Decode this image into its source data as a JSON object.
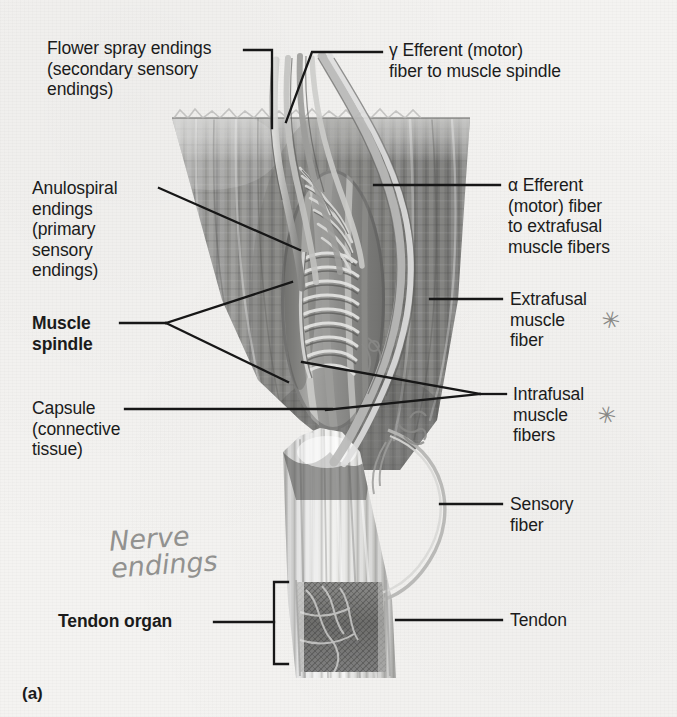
{
  "figure": {
    "id_label": "(a)",
    "domain_note": "scanned textbook anatomy figure of muscle spindle and tendon organ"
  },
  "labels": {
    "flower_spray": "Flower spray endings\n(secondary sensory\nendings)",
    "gamma_efferent": "γ Efferent (motor)\nfiber to muscle spindle",
    "anulospiral": "Anulospiral\nendings\n(primary\nsensory\nendings)",
    "muscle_spindle": "Muscle\nspindle",
    "capsule": "Capsule\n(connective\ntissue)",
    "alpha_efferent": "α Efferent\n(motor) fiber\nto extrafusal\nmuscle fibers",
    "extrafusal": "Extrafusal\nmuscle\nfiber",
    "intrafusal": "Intrafusal\nmuscle\nfibers",
    "sensory_fiber": "Sensory\nfiber",
    "tendon": "Tendon",
    "tendon_organ": "Tendon organ"
  },
  "annotations": {
    "handwritten_note": "Nerve\nendings",
    "star_extrafusal": "✳",
    "star_intrafusal": "✳"
  },
  "colors": {
    "paper": "#f4f3f1",
    "ink": "#1b1b1b",
    "muscle_mid": "#8e8e8e",
    "muscle_dark": "#6a6a6a",
    "muscle_light": "#c9c9c7",
    "pencil": "#8a8a88"
  }
}
